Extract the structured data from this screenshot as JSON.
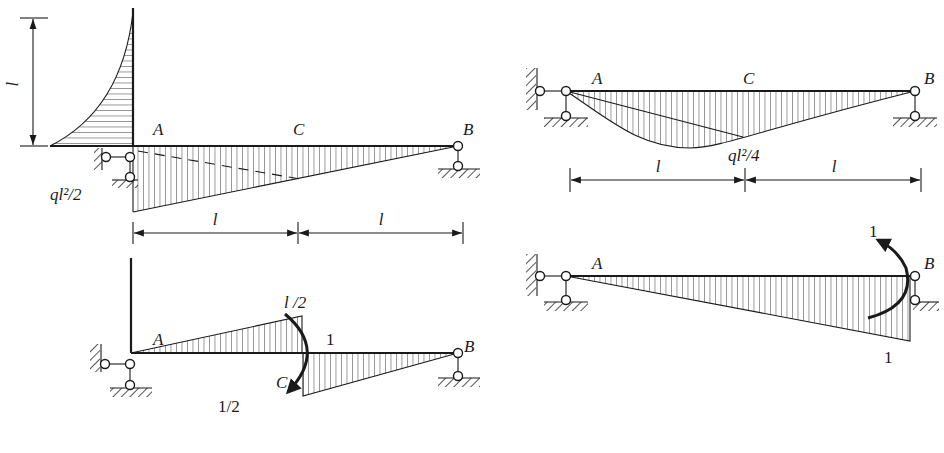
{
  "figure": {
    "panels": [
      {
        "id": "top-left",
        "title": "",
        "labels": {
          "A": "A",
          "C": "C",
          "B": "B",
          "moment": "ql²/2",
          "height_dim": "l",
          "span1": "l",
          "span2": "l"
        }
      },
      {
        "id": "bottom-left",
        "labels": {
          "A": "A",
          "C": "C",
          "B": "B",
          "top_value": "l /2",
          "bottom_value": "1/2",
          "moment": "1"
        }
      },
      {
        "id": "top-right",
        "labels": {
          "A": "A",
          "C": "C",
          "B": "B",
          "moment": "ql²/4",
          "span1": "l",
          "span2": "l"
        }
      },
      {
        "id": "bottom-right",
        "labels": {
          "A": "A",
          "B": "B",
          "moment_top": "1",
          "moment_bottom": "1"
        }
      }
    ],
    "colors": {
      "ink": "#1a1a1a",
      "background": "#ffffff"
    }
  }
}
